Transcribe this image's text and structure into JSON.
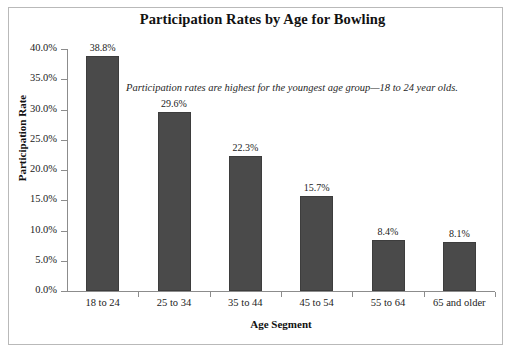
{
  "frame": {
    "background_color": "#ffffff",
    "border_color": "#b9b9b9"
  },
  "annotation": {
    "text": "Participation rates are highest for the youngest age group—18 to 24 year olds."
  },
  "chart_data": {
    "type": "bar",
    "title": "Participation Rates by Age for Bowling",
    "xlabel": "Age Segment",
    "ylabel": "Participation Rate",
    "categories": [
      "18 to 24",
      "25 to 34",
      "35 to 44",
      "45 to 54",
      "55 to 64",
      "65 and older"
    ],
    "values": [
      38.8,
      29.6,
      22.3,
      15.7,
      8.4,
      8.1
    ],
    "value_labels": [
      "38.8%",
      "29.6%",
      "22.3%",
      "15.7%",
      "8.4%",
      "8.1%"
    ],
    "ylim": [
      0,
      40
    ],
    "ytick_values": [
      0,
      5,
      10,
      15,
      20,
      25,
      30,
      35,
      40
    ],
    "ytick_labels": [
      "0.0%",
      "5.0%",
      "10.0%",
      "15.0%",
      "20.0%",
      "25.0%",
      "30.0%",
      "35.0%",
      "40.0%"
    ],
    "grid": false,
    "legend": null,
    "bar_color": "#4a4a4a",
    "bar_edge_color": "#3d3d3d",
    "axis_color": "#8c8c8c",
    "annotations": [
      "Participation rates are highest for the youngest age group—18 to 24 year olds."
    ]
  }
}
